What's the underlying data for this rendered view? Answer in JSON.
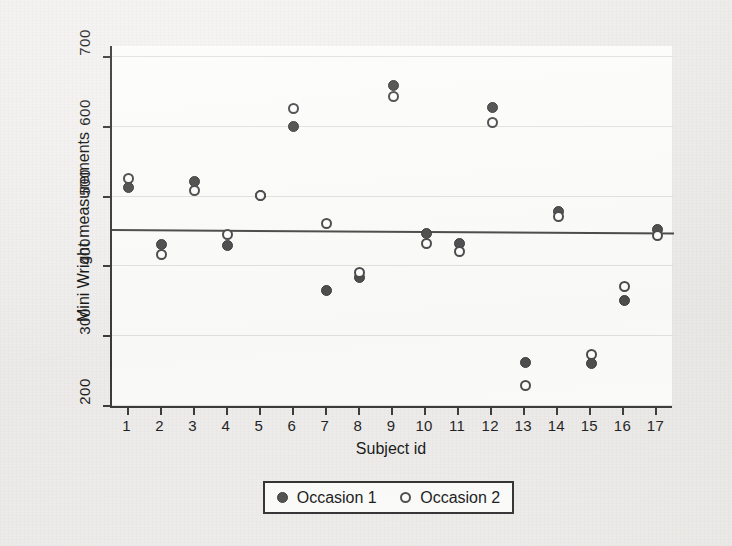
{
  "chart_data": {
    "type": "scatter",
    "title": "",
    "xlabel": "Subject id",
    "ylabel": "Mini Wright measurements",
    "xlim": [
      0.5,
      17.5
    ],
    "ylim": [
      195,
      715
    ],
    "grid": true,
    "legend_position": "bottom-center",
    "x": [
      1,
      2,
      3,
      4,
      5,
      6,
      7,
      8,
      9,
      10,
      11,
      12,
      13,
      14,
      15,
      16,
      17
    ],
    "xtick_labels": [
      "1",
      "2",
      "3",
      "4",
      "5",
      "6",
      "7",
      "8",
      "9",
      "10",
      "11",
      "12",
      "13",
      "14",
      "15",
      "16",
      "17"
    ],
    "ytick_labels": [
      "200",
      "300",
      "400",
      "500",
      "600",
      "700"
    ],
    "ytick_values": [
      200,
      300,
      400,
      500,
      600,
      700
    ],
    "series": [
      {
        "name": "Occasion 1",
        "marker": "filled-circle",
        "color": "#4d4d4d",
        "values": [
          512,
          430,
          520,
          428,
          500,
          600,
          364,
          382,
          658,
          445,
          432,
          626,
          260,
          477,
          259,
          350,
          451
        ]
      },
      {
        "name": "Occasion 2",
        "marker": "open-circle",
        "color": "#ffffff",
        "values": [
          525,
          415,
          508,
          444,
          500,
          625,
          460,
          390,
          642,
          432,
          420,
          605,
          227,
          470,
          272,
          370,
          443
        ]
      }
    ],
    "reference_line": {
      "label": "",
      "y_left": 452,
      "y_right": 447,
      "color": "#4a4a4a"
    }
  },
  "legend": {
    "entries": [
      {
        "label": "Occasion 1",
        "marker": "filled-circle"
      },
      {
        "label": "Occasion 2",
        "marker": "open-circle"
      }
    ]
  }
}
